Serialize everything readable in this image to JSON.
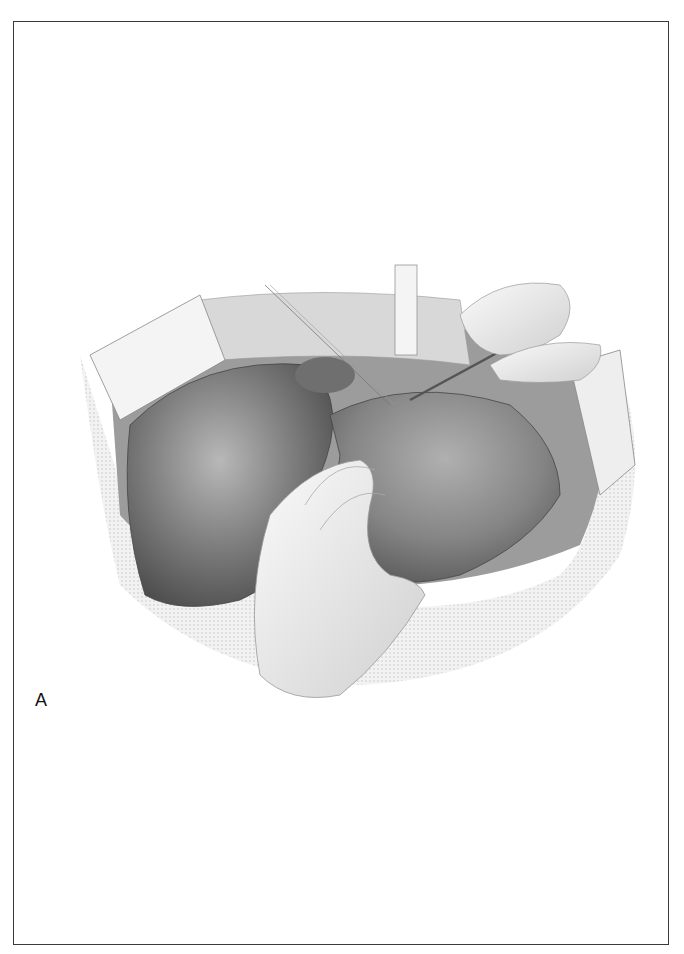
{
  "figure": {
    "panel_label": "A",
    "colors": {
      "border": "#3a3a3a",
      "background": "#ffffff",
      "liver_dark": "#5a5a5a",
      "liver_mid": "#8a8a8a",
      "liver_light": "#b5b5b5",
      "tissue": "#d9d9d9",
      "skin": "#eeeeee"
    }
  }
}
